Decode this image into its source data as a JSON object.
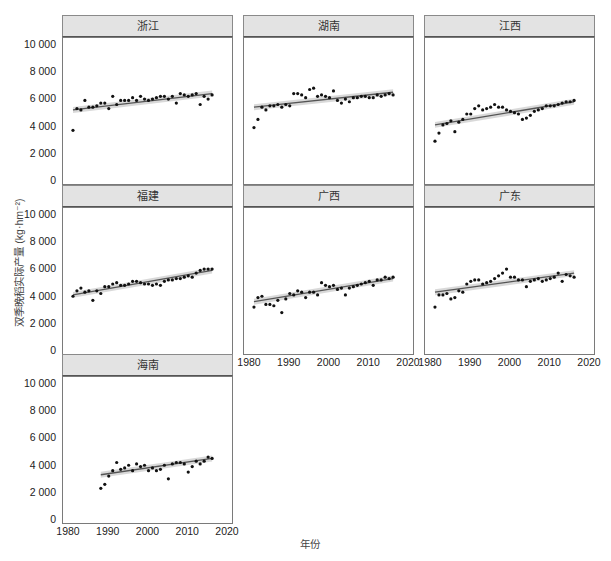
{
  "chart_data": {
    "type": "scatter",
    "subtype": "faceted scatter with linear regression and confidence band",
    "xlabel": "年份",
    "ylabel": "双季晚稻实际产量 (kg·hm⁻²)",
    "xlim": [
      1980,
      2020
    ],
    "ylim": [
      0,
      10000
    ],
    "x_ticks": [
      "1980",
      "1990",
      "2000",
      "2010",
      "2020"
    ],
    "y_ticks": [
      "0",
      "2 000",
      "4 000",
      "6 000",
      "8 000",
      "10 000"
    ],
    "grid": false,
    "facets": [
      {
        "name": "浙江",
        "x": [
          1981,
          1982,
          1983,
          1984,
          1985,
          1986,
          1987,
          1988,
          1989,
          1990,
          1991,
          1992,
          1993,
          1994,
          1995,
          1996,
          1997,
          1998,
          1999,
          2000,
          2001,
          2002,
          2003,
          2004,
          2005,
          2006,
          2007,
          2008,
          2009,
          2010,
          2011,
          2012,
          2013,
          2014,
          2015,
          2016
        ],
        "y": [
          3800,
          5400,
          5300,
          6000,
          5500,
          5500,
          5600,
          5800,
          5800,
          5400,
          6300,
          5700,
          6000,
          6000,
          6000,
          6200,
          6000,
          6300,
          6100,
          6000,
          6100,
          6200,
          6300,
          6300,
          6100,
          6300,
          5800,
          6500,
          6400,
          6300,
          6400,
          6500,
          5700,
          6300,
          6100,
          6400
        ],
        "trend": [
          5300,
          6500
        ]
      },
      {
        "name": "湖南",
        "x": [
          1981,
          1982,
          1983,
          1984,
          1985,
          1986,
          1987,
          1988,
          1989,
          1990,
          1991,
          1992,
          1993,
          1994,
          1995,
          1996,
          1997,
          1998,
          1999,
          2000,
          2001,
          2002,
          2003,
          2004,
          2005,
          2006,
          2007,
          2008,
          2009,
          2010,
          2011,
          2012,
          2013,
          2014,
          2015,
          2016
        ],
        "y": [
          4000,
          4600,
          5500,
          5300,
          5600,
          5600,
          5700,
          5500,
          5700,
          5600,
          6500,
          6500,
          6400,
          6200,
          6800,
          6900,
          6300,
          6400,
          6300,
          6200,
          6700,
          6000,
          5800,
          6100,
          5900,
          6200,
          6200,
          6300,
          6300,
          6200,
          6200,
          6400,
          6300,
          6400,
          6500,
          6400
        ],
        "trend": [
          5500,
          6600
        ]
      },
      {
        "name": "江西",
        "x": [
          1981,
          1982,
          1983,
          1984,
          1985,
          1986,
          1987,
          1988,
          1989,
          1990,
          1991,
          1992,
          1993,
          1994,
          1995,
          1996,
          1997,
          1998,
          1999,
          2000,
          2001,
          2002,
          2003,
          2004,
          2005,
          2006,
          2007,
          2008,
          2009,
          2010,
          2011,
          2012,
          2013,
          2014,
          2015,
          2016
        ],
        "y": [
          3000,
          3600,
          4200,
          4300,
          4500,
          3700,
          4400,
          4600,
          5000,
          5000,
          5400,
          5600,
          5300,
          5400,
          5500,
          5700,
          5500,
          5500,
          5300,
          5200,
          5100,
          5000,
          4600,
          4700,
          4900,
          5200,
          5300,
          5400,
          5600,
          5600,
          5600,
          5700,
          5800,
          5900,
          5900,
          6000
        ],
        "trend": [
          4200,
          5900
        ]
      },
      {
        "name": "福建",
        "x": [
          1981,
          1982,
          1983,
          1984,
          1985,
          1986,
          1987,
          1988,
          1989,
          1990,
          1991,
          1992,
          1993,
          1994,
          1995,
          1996,
          1997,
          1998,
          1999,
          2000,
          2001,
          2002,
          2003,
          2004,
          2005,
          2006,
          2007,
          2008,
          2009,
          2010,
          2011,
          2012,
          2013,
          2014,
          2015,
          2016
        ],
        "y": [
          4100,
          4500,
          4700,
          4400,
          4500,
          3800,
          4500,
          4300,
          4800,
          4800,
          5000,
          5100,
          4900,
          4900,
          5000,
          5200,
          5200,
          5100,
          5000,
          5000,
          4900,
          5000,
          4900,
          5200,
          5300,
          5300,
          5400,
          5400,
          5500,
          5600,
          5500,
          5800,
          6000,
          6100,
          6100,
          6100
        ],
        "trend": [
          4200,
          6000
        ]
      },
      {
        "name": "广西",
        "x": [
          1981,
          1982,
          1983,
          1984,
          1985,
          1986,
          1987,
          1988,
          1989,
          1990,
          1991,
          1992,
          1993,
          1994,
          1995,
          1996,
          1997,
          1998,
          1999,
          2000,
          2001,
          2002,
          2003,
          2004,
          2005,
          2006,
          2007,
          2008,
          2009,
          2010,
          2011,
          2012,
          2013,
          2014,
          2015,
          2016
        ],
        "y": [
          3300,
          4000,
          4100,
          3500,
          3500,
          3400,
          3800,
          2900,
          3900,
          4300,
          4200,
          4500,
          4400,
          4000,
          4400,
          4400,
          4200,
          5100,
          4900,
          4800,
          4900,
          4600,
          4700,
          4200,
          4700,
          4800,
          4900,
          5000,
          5100,
          5200,
          4900,
          5300,
          5300,
          5500,
          5400,
          5500
        ],
        "trend": [
          3700,
          5400
        ]
      },
      {
        "name": "广东",
        "x": [
          1981,
          1982,
          1983,
          1984,
          1985,
          1986,
          1987,
          1988,
          1989,
          1990,
          1991,
          1992,
          1993,
          1994,
          1995,
          1996,
          1997,
          1998,
          1999,
          2000,
          2001,
          2002,
          2003,
          2004,
          2005,
          2006,
          2007,
          2008,
          2009,
          2010,
          2011,
          2012,
          2013,
          2014,
          2015,
          2016
        ],
        "y": [
          3300,
          4200,
          4200,
          4300,
          3900,
          4000,
          4500,
          4400,
          5000,
          5200,
          5300,
          5300,
          5000,
          5100,
          5200,
          5400,
          5600,
          5800,
          6100,
          5500,
          5500,
          5300,
          5300,
          4800,
          5200,
          5300,
          5400,
          5200,
          5300,
          5400,
          5500,
          5800,
          5200,
          5700,
          5600,
          5500
        ],
        "trend": [
          4400,
          5800
        ]
      },
      {
        "name": "海南",
        "x": [
          1988,
          1989,
          1990,
          1991,
          1992,
          1993,
          1994,
          1995,
          1996,
          1997,
          1998,
          1999,
          2000,
          2001,
          2002,
          2003,
          2004,
          2005,
          2006,
          2007,
          2008,
          2009,
          2010,
          2011,
          2012,
          2013,
          2014,
          2015,
          2016
        ],
        "y": [
          2400,
          2700,
          3300,
          3700,
          4300,
          3800,
          3900,
          4100,
          3700,
          4200,
          4000,
          4100,
          3700,
          3900,
          3700,
          3800,
          4100,
          3100,
          4200,
          4300,
          4300,
          4200,
          3600,
          4000,
          4400,
          4200,
          4400,
          4700,
          4600
        ],
        "trend": [
          3400,
          4600
        ]
      }
    ]
  },
  "colors": {
    "strip_bg": "#e3e3e3",
    "points": "#111111",
    "trend_line": "#555555",
    "confidence_band": "#cfcfcf"
  }
}
